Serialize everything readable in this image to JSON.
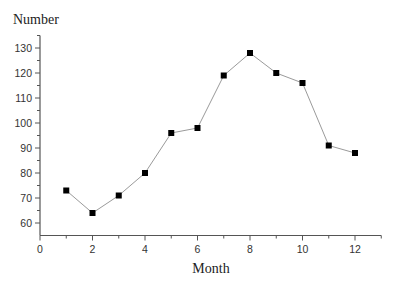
{
  "chart_data": {
    "type": "line",
    "title": "",
    "xlabel": "Month",
    "ylabel": "Number",
    "x": [
      1,
      2,
      3,
      4,
      5,
      6,
      7,
      8,
      9,
      10,
      11,
      12
    ],
    "values": [
      73,
      64,
      71,
      80,
      96,
      98,
      119,
      128,
      120,
      116,
      91,
      88
    ],
    "series": [
      {
        "name": "Number",
        "x": [
          1,
          2,
          3,
          4,
          5,
          6,
          7,
          8,
          9,
          10,
          11,
          12
        ],
        "values": [
          73,
          64,
          71,
          80,
          96,
          98,
          119,
          128,
          120,
          116,
          91,
          88
        ],
        "marker": "square",
        "line_color": "#9a9a9a",
        "marker_color": "#000000"
      }
    ],
    "xlim": [
      0,
      13
    ],
    "ylim": [
      55,
      135
    ],
    "xticks": [
      0,
      2,
      4,
      6,
      8,
      10,
      12
    ],
    "yticks": [
      60,
      70,
      80,
      90,
      100,
      110,
      120,
      130
    ],
    "grid": false,
    "legend": null
  },
  "axes": {
    "x_title": "Month",
    "y_title": "Number",
    "x_tick_labels": [
      "0",
      "2",
      "4",
      "6",
      "8",
      "10",
      "12"
    ],
    "y_tick_labels": [
      "130",
      "120",
      "110",
      "100",
      "90",
      "80",
      "70",
      "60"
    ]
  }
}
